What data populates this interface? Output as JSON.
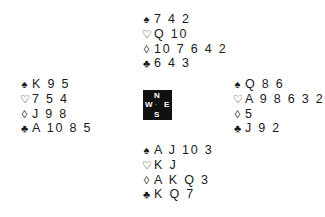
{
  "diagram": {
    "type": "bridge-deal",
    "suit_symbols": {
      "spades": "♠",
      "hearts": "♡",
      "diamonds": "◊",
      "clubs": "♣"
    },
    "hands": {
      "north": {
        "spades": "7 4 2",
        "hearts": "Q 10",
        "diamonds": "10 7 6 4 2",
        "clubs": "6 4 3"
      },
      "west": {
        "spades": "K 9 5",
        "hearts": "7 5 4",
        "diamonds": "J 9 8",
        "clubs": "A 10 8 5"
      },
      "east": {
        "spades": "Q 8 6",
        "hearts": "A 9 8 6 3 2",
        "diamonds": "5",
        "clubs": "J 9 2"
      },
      "south": {
        "spades": "A J 10 3",
        "hearts": "K J",
        "diamonds": "A K Q 3",
        "clubs": "K Q 7"
      }
    },
    "compass": {
      "north": "N",
      "south": "S",
      "west": "W",
      "east": "E",
      "center": "·"
    }
  }
}
